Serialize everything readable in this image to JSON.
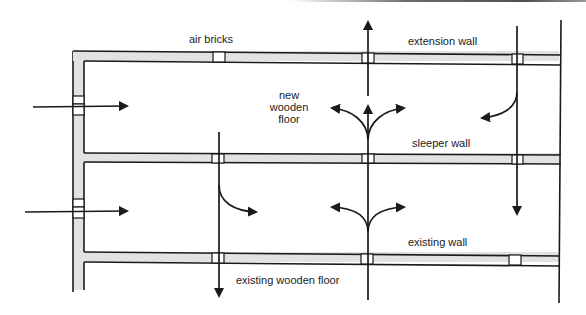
{
  "diagram": {
    "labels": {
      "air_bricks": "air bricks",
      "extension_wall": "extension wall",
      "new_wooden_floor_1": "new",
      "new_wooden_floor_2": "wooden",
      "new_wooden_floor_3": "floor",
      "sleeper_wall": "sleeper wall",
      "existing_wall": "existing wall",
      "existing_wooden_floor": "existing wooden floor"
    },
    "walls": [
      {
        "name": "extension wall",
        "y_top": 51,
        "y_bottom": 61,
        "air_bricks_x": [
          213,
          362,
          512
        ]
      },
      {
        "name": "sleeper wall",
        "y_top": 153,
        "y_bottom": 162,
        "air_bricks_x": [
          212,
          362,
          512
        ]
      },
      {
        "name": "existing wall",
        "y_top": 252,
        "y_bottom": 262,
        "air_bricks_x": [
          212,
          361,
          509
        ]
      }
    ],
    "side_wall": {
      "x_left": 73,
      "x_right": 84,
      "vents_y": [
        96,
        199
      ]
    },
    "airflow_arrows": [
      "left inlet into new floor void",
      "left inlet into existing floor void",
      "upward through extension wall air brick",
      "three-way split above sleeper wall",
      "two-way split above existing wall",
      "down through sleeper wall (right)",
      "down through existing wall (left)",
      "curved turn into new floor void (right)",
      "curved turn into existing floor void (left)"
    ],
    "colors": {
      "line": "#1a1a1a",
      "wall_fill": "#e2e2e2",
      "background": "#ffffff"
    }
  }
}
